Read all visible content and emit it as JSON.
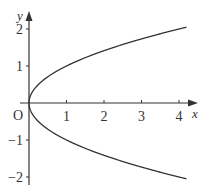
{
  "chart_data": {
    "type": "line",
    "title": "",
    "xlabel": "x",
    "ylabel": "y",
    "origin_label": "O",
    "equation": "y^2 = x",
    "xlim": [
      0,
      4.4
    ],
    "ylim": [
      -2.2,
      2.4
    ],
    "x_ticks": [
      1,
      2,
      3,
      4
    ],
    "x_tick_labels": [
      "1",
      "2",
      "3",
      "4"
    ],
    "y_ticks": [
      2,
      1,
      -1,
      -2
    ],
    "y_tick_labels": [
      "2",
      "1",
      "−1",
      "−2"
    ],
    "grid": false,
    "legend": null,
    "series": [
      {
        "name": "upper branch y = √x",
        "x": [
          0,
          0.05,
          0.25,
          0.5,
          1,
          1.5,
          2,
          2.5,
          3,
          3.5,
          4,
          4.2
        ],
        "y": [
          0,
          0.224,
          0.5,
          0.707,
          1,
          1.225,
          1.414,
          1.581,
          1.732,
          1.871,
          2,
          2.049
        ]
      },
      {
        "name": "lower branch y = −√x",
        "x": [
          0,
          0.05,
          0.25,
          0.5,
          1,
          1.5,
          2,
          2.5,
          3,
          3.5,
          4,
          4.2
        ],
        "y": [
          0,
          -0.224,
          -0.5,
          -0.707,
          -1,
          -1.225,
          -1.414,
          -1.581,
          -1.732,
          -1.871,
          -2,
          -2.049
        ]
      }
    ],
    "colors": {
      "axis": "#333333",
      "curve": "#333333"
    }
  }
}
